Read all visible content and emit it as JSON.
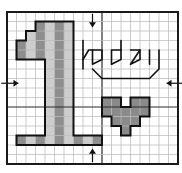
{
  "pattern": {
    "type": "cross-stitch chart",
    "title": "1 today",
    "grid": {
      "cols": 18,
      "rows": 16,
      "origin_x": 7,
      "origin_y": 12,
      "cell": 9.5,
      "major_every": 10,
      "center_col": 10,
      "center_row": 7.5
    },
    "colors": {
      "background": "#ffffff",
      "grid_minor": "#b8b8b8",
      "grid_major": "#2a2a2a",
      "border": "#1a1a1a",
      "dark_fill": "#8e8e8e",
      "light_fill": "#cdcdcd",
      "heart_fill": "#8a8a8a",
      "outline": "#111111",
      "backstitch": "#111111"
    },
    "backstitch_text": "today",
    "number_motif": "1",
    "heart_motif": "heart",
    "cells": [
      {
        "c": 3,
        "r": 1,
        "t": "dark"
      },
      {
        "c": 4,
        "r": 1,
        "t": "light"
      },
      {
        "c": 5,
        "r": 1,
        "t": "dark"
      },
      {
        "c": 6,
        "r": 1,
        "t": "light"
      },
      {
        "c": 2,
        "r": 2,
        "t": "light"
      },
      {
        "c": 3,
        "r": 2,
        "t": "dark"
      },
      {
        "c": 4,
        "r": 2,
        "t": "light"
      },
      {
        "c": 5,
        "r": 2,
        "t": "dark"
      },
      {
        "c": 6,
        "r": 2,
        "t": "light"
      },
      {
        "c": 1,
        "r": 3,
        "t": "dark"
      },
      {
        "c": 2,
        "r": 3,
        "t": "light"
      },
      {
        "c": 3,
        "r": 3,
        "t": "dark"
      },
      {
        "c": 4,
        "r": 3,
        "t": "light"
      },
      {
        "c": 5,
        "r": 3,
        "t": "dark"
      },
      {
        "c": 6,
        "r": 3,
        "t": "light"
      },
      {
        "c": 1,
        "r": 4,
        "t": "dark"
      },
      {
        "c": 2,
        "r": 4,
        "t": "light"
      },
      {
        "c": 3,
        "r": 4,
        "t": "dark"
      },
      {
        "c": 4,
        "r": 4,
        "t": "light"
      },
      {
        "c": 5,
        "r": 4,
        "t": "dark"
      },
      {
        "c": 6,
        "r": 4,
        "t": "light"
      },
      {
        "c": 4,
        "r": 5,
        "t": "light"
      },
      {
        "c": 5,
        "r": 5,
        "t": "dark"
      },
      {
        "c": 6,
        "r": 5,
        "t": "light"
      },
      {
        "c": 4,
        "r": 6,
        "t": "light"
      },
      {
        "c": 5,
        "r": 6,
        "t": "dark"
      },
      {
        "c": 6,
        "r": 6,
        "t": "light"
      },
      {
        "c": 4,
        "r": 7,
        "t": "light"
      },
      {
        "c": 5,
        "r": 7,
        "t": "dark"
      },
      {
        "c": 6,
        "r": 7,
        "t": "light"
      },
      {
        "c": 4,
        "r": 8,
        "t": "light"
      },
      {
        "c": 5,
        "r": 8,
        "t": "dark"
      },
      {
        "c": 6,
        "r": 8,
        "t": "light"
      },
      {
        "c": 4,
        "r": 9,
        "t": "light"
      },
      {
        "c": 5,
        "r": 9,
        "t": "dark"
      },
      {
        "c": 6,
        "r": 9,
        "t": "light"
      },
      {
        "c": 4,
        "r": 10,
        "t": "light"
      },
      {
        "c": 5,
        "r": 10,
        "t": "dark"
      },
      {
        "c": 6,
        "r": 10,
        "t": "light"
      },
      {
        "c": 4,
        "r": 11,
        "t": "light"
      },
      {
        "c": 5,
        "r": 11,
        "t": "dark"
      },
      {
        "c": 6,
        "r": 11,
        "t": "light"
      },
      {
        "c": 4,
        "r": 12,
        "t": "light"
      },
      {
        "c": 5,
        "r": 12,
        "t": "dark"
      },
      {
        "c": 6,
        "r": 12,
        "t": "light"
      },
      {
        "c": 1,
        "r": 13,
        "t": "dark"
      },
      {
        "c": 2,
        "r": 13,
        "t": "light"
      },
      {
        "c": 3,
        "r": 13,
        "t": "dark"
      },
      {
        "c": 4,
        "r": 13,
        "t": "light"
      },
      {
        "c": 5,
        "r": 13,
        "t": "dark"
      },
      {
        "c": 6,
        "r": 13,
        "t": "light"
      },
      {
        "c": 7,
        "r": 13,
        "t": "dark"
      },
      {
        "c": 8,
        "r": 13,
        "t": "light"
      },
      {
        "c": 9,
        "r": 13,
        "t": "dark"
      },
      {
        "c": 10,
        "r": 9,
        "t": "heart"
      },
      {
        "c": 11,
        "r": 9,
        "t": "heart"
      },
      {
        "c": 13,
        "r": 9,
        "t": "heart"
      },
      {
        "c": 14,
        "r": 9,
        "t": "heart"
      },
      {
        "c": 10,
        "r": 10,
        "t": "heart"
      },
      {
        "c": 11,
        "r": 10,
        "t": "heart"
      },
      {
        "c": 12,
        "r": 10,
        "t": "heart"
      },
      {
        "c": 13,
        "r": 10,
        "t": "heart"
      },
      {
        "c": 14,
        "r": 10,
        "t": "heart"
      },
      {
        "c": 11,
        "r": 11,
        "t": "heart"
      },
      {
        "c": 12,
        "r": 11,
        "t": "heart"
      },
      {
        "c": 13,
        "r": 11,
        "t": "heart"
      },
      {
        "c": 12,
        "r": 12,
        "t": "heart"
      }
    ],
    "one_outline": [
      [
        3,
        1
      ],
      [
        7,
        1
      ],
      [
        7,
        13
      ],
      [
        10,
        13
      ],
      [
        10,
        14
      ],
      [
        1,
        14
      ],
      [
        1,
        13
      ],
      [
        4,
        13
      ],
      [
        4,
        5
      ],
      [
        1,
        5
      ],
      [
        1,
        3
      ],
      [
        2,
        3
      ],
      [
        2,
        2
      ],
      [
        3,
        2
      ]
    ],
    "heart_outline": [
      [
        10,
        9
      ],
      [
        12,
        9
      ],
      [
        12,
        10
      ],
      [
        13,
        10
      ],
      [
        13,
        9
      ],
      [
        15,
        9
      ],
      [
        15,
        11
      ],
      [
        14,
        11
      ],
      [
        14,
        12
      ],
      [
        13,
        12
      ],
      [
        13,
        13
      ],
      [
        12,
        13
      ],
      [
        12,
        12
      ],
      [
        11,
        12
      ],
      [
        11,
        11
      ],
      [
        10,
        11
      ]
    ],
    "backstitch_paths": [
      [
        [
          8,
          6
        ],
        [
          8,
          3
        ]
      ],
      [
        [
          8,
          5
        ],
        [
          8.6,
          4
        ],
        [
          9,
          4
        ]
      ],
      [
        [
          9,
          5.5
        ],
        [
          9,
          4
        ],
        [
          10,
          4
        ],
        [
          10,
          5
        ],
        [
          9,
          5.5
        ]
      ],
      [
        [
          11,
          5.5
        ],
        [
          11,
          4
        ],
        [
          12,
          4
        ],
        [
          12,
          3
        ]
      ],
      [
        [
          12,
          4
        ],
        [
          12,
          5
        ],
        [
          11,
          5.5
        ]
      ],
      [
        [
          13,
          5.5
        ],
        [
          14,
          4
        ],
        [
          14,
          5
        ],
        [
          13,
          5.5
        ]
      ],
      [
        [
          13,
          4
        ],
        [
          14,
          4
        ]
      ],
      [
        [
          15,
          5.5
        ],
        [
          15,
          4
        ]
      ],
      [
        [
          16,
          4
        ],
        [
          16,
          6
        ],
        [
          15,
          7
        ],
        [
          10,
          7
        ],
        [
          9,
          6
        ]
      ]
    ],
    "center_arrows": [
      {
        "name": "top-center-arrow",
        "x1": 9,
        "y1": 0.2,
        "x2": 9,
        "y2": 1.6
      },
      {
        "name": "bottom-center-arrow",
        "x1": 9,
        "y1": 15.8,
        "x2": 9,
        "y2": 14.4
      },
      {
        "name": "left-center-arrow",
        "x1": -0.6,
        "y1": 7.5,
        "x2": 1.2,
        "y2": 7.5
      },
      {
        "name": "right-center-arrow",
        "x1": 18.6,
        "y1": 7.5,
        "x2": 16.8,
        "y2": 7.5
      }
    ]
  }
}
